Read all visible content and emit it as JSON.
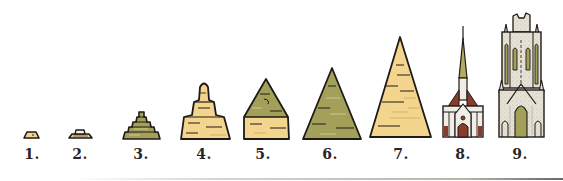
{
  "figure": {
    "colors": {
      "sand": "#f4d58d",
      "olive": "#a3a05a",
      "outline": "#1f1a17",
      "stone": "#e6e2d6",
      "brick": "#8a3b2c",
      "spire_green": "#b3ad5e",
      "label": "#2a2624"
    },
    "items": [
      {
        "label": "1.",
        "kind": "small-slab",
        "fill": "sand",
        "x": 30
      },
      {
        "label": "2.",
        "kind": "flat-slab-with-block",
        "fill": "stone",
        "x": 80
      },
      {
        "label": "3.",
        "kind": "stepped-pyramid",
        "fill": "olive",
        "x": 141
      },
      {
        "label": "4.",
        "kind": "stepped-tower",
        "fill": "sand",
        "x": 206
      },
      {
        "label": "5.",
        "kind": "pyramid-two-tone",
        "fill": "olive-over-sand",
        "x": 266
      },
      {
        "label": "6.",
        "kind": "pyramid",
        "fill": "olive",
        "x": 332
      },
      {
        "label": "7.",
        "kind": "tall-pyramid",
        "fill": "sand",
        "x": 404
      },
      {
        "label": "8.",
        "kind": "spired-church",
        "fill": "stone-brick",
        "x": 464
      },
      {
        "label": "9.",
        "kind": "cathedral-tower",
        "fill": "stone-olive",
        "x": 521
      }
    ]
  }
}
